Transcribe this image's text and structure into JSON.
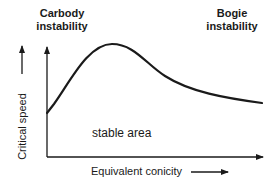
{
  "labels": {
    "carbody": [
      "Carbody",
      "instability"
    ],
    "bogie": [
      "Bogie",
      "instability"
    ],
    "stable_area": "stable area",
    "x_axis": "Equivalent conicity",
    "y_axis": "Critical speed"
  },
  "colors": {
    "line": "#1a1a1a",
    "background": "#ffffff"
  },
  "curve": {
    "description": "Critical speed rises with equivalent conicity to a peak (carbody instability region), then decreases gradually (bogie instability region)",
    "points": [
      [
        0,
        0.33
      ],
      [
        0.1,
        0.6
      ],
      [
        0.3,
        0.96
      ],
      [
        0.45,
        0.9
      ],
      [
        0.6,
        0.72
      ],
      [
        0.8,
        0.6
      ],
      [
        1.0,
        0.52
      ]
    ]
  }
}
